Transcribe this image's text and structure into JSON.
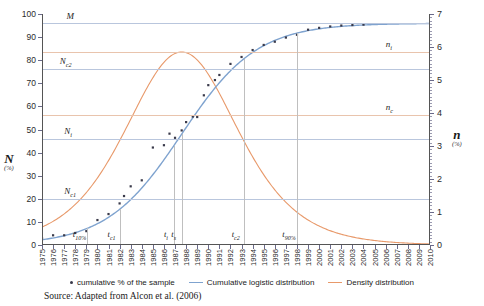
{
  "chart_data": {
    "type": "line",
    "title": "",
    "subtitle": "",
    "xlabel": "",
    "ylabel": "N",
    "ylabel_unit": "(%)",
    "y2label": "n",
    "y2label_unit": "(%)",
    "xlim": [
      1975,
      2010
    ],
    "ylim": [
      0,
      100
    ],
    "y2lim": [
      0,
      7
    ],
    "grid": true,
    "legend_position": "bottom",
    "x_tick_labels": [
      "1975",
      "1976",
      "1977",
      "1978",
      "1979",
      "1980",
      "1981",
      "1982",
      "1983",
      "1984",
      "1985",
      "1986",
      "1987",
      "1988",
      "1989",
      "1990",
      "1991",
      "1992",
      "1993",
      "1994",
      "1995",
      "1996",
      "1997",
      "1998",
      "1999",
      "2000",
      "2001",
      "2002",
      "2003",
      "2004",
      "2005",
      "2006",
      "2007",
      "2008",
      "2009",
      "2010"
    ],
    "y_tick_labels": [
      "0",
      "10",
      "20",
      "30",
      "40",
      "50",
      "60",
      "70",
      "80",
      "90",
      "100"
    ],
    "y_tick_values": [
      0,
      10,
      20,
      30,
      40,
      50,
      60,
      70,
      80,
      90,
      100
    ],
    "y2_tick_labels": [
      "0",
      "1",
      "2",
      "3",
      "4",
      "5",
      "6",
      "7"
    ],
    "y2_tick_values": [
      0,
      1,
      2,
      3,
      4,
      5,
      6,
      7
    ],
    "series": [
      {
        "name": "cumulative % of the sample",
        "type": "scatter",
        "color": "#3a3a4a",
        "axis": "left",
        "x": [
          1975,
          1976,
          1977,
          1978,
          1979,
          1980,
          1981,
          1982,
          1982.4,
          1983,
          1984,
          1985,
          1986,
          1986.5,
          1987,
          1987.6,
          1988,
          1988.6,
          1989,
          1989.6,
          1990,
          1990.6,
          1991,
          1992,
          1993,
          1994,
          1995,
          1996,
          1997,
          1998,
          1999,
          2000,
          2001,
          2002,
          2003,
          2004
        ],
        "y": [
          3.0,
          4.2,
          4.2,
          5.2,
          6.0,
          10.8,
          13.4,
          18.0,
          21.2,
          25.4,
          28.0,
          42.2,
          43.2,
          48.2,
          46.4,
          49.6,
          53.2,
          55.6,
          55.4,
          64.8,
          69.2,
          71.4,
          73.6,
          78.4,
          81.4,
          84.4,
          86.6,
          88.0,
          89.8,
          91.0,
          93.2,
          94.0,
          94.6,
          95.0,
          95.2,
          95.4
        ]
      },
      {
        "name": "Cumulative logistic distribution",
        "type": "line",
        "color": "#7fa3cf",
        "axis": "left",
        "description": "Logistic S-curve rising from about 4% in 1975 to a saturation level M of about 96% by 2004",
        "parameters": {
          "M": 96,
          "inflection_year": 1987.6,
          "growth_rate": 0.295
        }
      },
      {
        "name": "Density distribution",
        "type": "line",
        "color": "#e8996a",
        "axis": "right",
        "description": "Bell-shaped derivative of the logistic curve, peaking at about 5.85 (right axis) near 1987.6 and decaying towards 0 by 2010",
        "parameters": {
          "peak_value": 5.85,
          "peak_year": 1987.6
        }
      }
    ],
    "reference_levels": [
      {
        "label": "M",
        "label_sub": "",
        "value": 96,
        "axis": "left",
        "line_color": "#b9c6dd",
        "x_label_year": 1977.2
      },
      {
        "label": "N",
        "label_sub": "c2",
        "value": 76,
        "axis": "left",
        "line_color": "#b9c6dd",
        "x_label_year": 1976.6
      },
      {
        "label": "N",
        "label_sub": "i",
        "value": 46,
        "axis": "left",
        "line_color": "#b9c6dd",
        "x_label_year": 1977.0
      },
      {
        "label": "N",
        "label_sub": "c1",
        "value": 20,
        "axis": "left",
        "line_color": "#b9c6dd",
        "x_label_year": 1977.0
      },
      {
        "label": "n",
        "label_sub": "i",
        "value": 5.85,
        "axis": "right",
        "line_color": "#e9c4ad",
        "x_label_year": 2006.0
      },
      {
        "label": "n",
        "label_sub": "c",
        "value": 3.95,
        "axis": "right",
        "line_color": "#e9c4ad",
        "x_label_year": 2006.0
      }
    ],
    "time_markers": [
      {
        "label": "t",
        "label_sub": "10%",
        "year": 1979.1
      },
      {
        "label": "t",
        "label_sub": "c1",
        "year": 1982.0
      },
      {
        "label": "t",
        "label_sub": "i",
        "year": 1986.9
      },
      {
        "label": "t",
        "label_sub": "s",
        "year": 1987.6
      },
      {
        "label": "t",
        "label_sub": "c2",
        "year": 1993.2
      },
      {
        "label": "t",
        "label_sub": "90%",
        "year": 1998.0
      }
    ],
    "annotations": []
  },
  "legend": {
    "items": [
      {
        "label": "cumulative % of the sample",
        "marker": "dot",
        "color": "#3a3a4a"
      },
      {
        "label": "Cumulative logistic distribution",
        "marker": "line",
        "color": "#7fa3cf"
      },
      {
        "label": "Density distribution",
        "marker": "line",
        "color": "#e8996a"
      }
    ]
  },
  "source": {
    "text": "Source: Adapted from Alcon et al. (2006)"
  },
  "colors": {
    "scatter": "#3a3a4a",
    "cumulative": "#7fa3cf",
    "density": "#e8996a",
    "guide_blue": "#b9c6dd",
    "guide_orange": "#e9c4ad",
    "guide_gray": "#bfbfbf",
    "axis": "#555555"
  }
}
